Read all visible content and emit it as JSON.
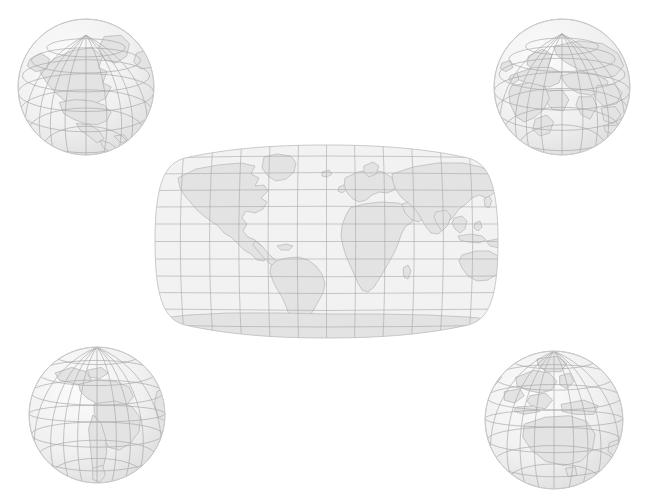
{
  "scene": {
    "title": "World map with four corner globe views",
    "background_color": "#ffffff",
    "width": 649,
    "height": 503
  },
  "style": {
    "ocean_color": "#f2f2f2",
    "land_color": "#e3e3e3",
    "land_outline_color": "#b6b6b6",
    "graticule_color": "#a8a8a8",
    "map_outline_color": "#bcbcbc",
    "globe_edge_color": "#c9c9c9",
    "globe_highlight_color": "#fbfbfb",
    "globe_shadow_color": "#e0e0e0"
  },
  "main_map": {
    "name": "world-map",
    "projection": "Robinson",
    "center_longitude": 0,
    "graticule_interval_degrees": 15,
    "bounds": {
      "x": 148,
      "y": 143,
      "width": 357,
      "height": 197
    },
    "continents": [
      "North America",
      "South America",
      "Africa",
      "Europe",
      "Asia",
      "Australia",
      "Antarctica"
    ]
  },
  "globes": [
    {
      "name": "globe-north-america",
      "label": "North America",
      "position": "top-left",
      "center_lat": 45,
      "center_lon": -100,
      "bounds": {
        "x": 16,
        "y": 17,
        "width": 140,
        "height": 140
      },
      "features": [
        "North America",
        "Greenland",
        "Arctic"
      ]
    },
    {
      "name": "globe-eurasia",
      "label": "Europe, Asia and Africa",
      "position": "top-right",
      "center_lat": 40,
      "center_lon": 60,
      "bounds": {
        "x": 492,
        "y": 17,
        "width": 140,
        "height": 140
      },
      "features": [
        "Europe",
        "Asia",
        "Africa",
        "Arabia",
        "India"
      ]
    },
    {
      "name": "globe-south-america",
      "label": "South America",
      "position": "bottom-left",
      "center_lat": -15,
      "center_lon": -60,
      "bounds": {
        "x": 27,
        "y": 345,
        "width": 140,
        "height": 140
      },
      "features": [
        "South America",
        "Central America",
        "Caribbean"
      ]
    },
    {
      "name": "globe-oceania",
      "label": "Australia and Oceania",
      "position": "bottom-right",
      "center_lat": -20,
      "center_lon": 135,
      "bounds": {
        "x": 483,
        "y": 349,
        "width": 142,
        "height": 142
      },
      "features": [
        "Australia",
        "New Guinea",
        "Indonesia",
        "Southeast Asia"
      ]
    }
  ]
}
